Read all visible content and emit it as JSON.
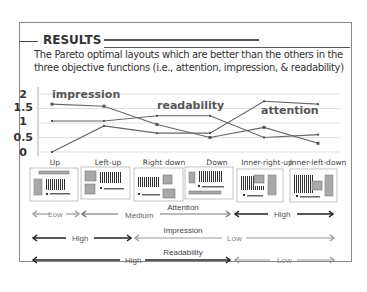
{
  "header": {
    "title": "RESULTS",
    "description_line1": "The Pareto optimal layouts which are better than the others in the",
    "description_line2": "three objective functions  (i.e., attention, impression, & readability)"
  },
  "chart_data": {
    "type": "line",
    "title": "",
    "xlabel": "",
    "ylabel": "",
    "ylim": [
      0,
      2
    ],
    "yticks": [
      "2",
      "1.5",
      "1",
      "0.5",
      "0"
    ],
    "grid": true,
    "categories": [
      "Up",
      "Left-up",
      "Right down",
      "Down",
      "Inner-right-up",
      "Inner-left-down"
    ],
    "series": [
      {
        "name": "impression",
        "values": [
          1.65,
          1.58,
          0.95,
          0.5,
          0.85,
          0.3
        ]
      },
      {
        "name": "readability",
        "values": [
          1.07,
          1.07,
          1.25,
          1.25,
          0.5,
          0.6
        ]
      },
      {
        "name": "attention",
        "values": [
          0,
          0.9,
          0.65,
          0.65,
          1.75,
          1.65
        ]
      }
    ],
    "annotations": [
      "impression",
      "readability",
      "attention"
    ]
  },
  "layouts": [
    "Up",
    "Left-up",
    "Right down",
    "Down",
    "Inner-right-up",
    "Inner-left-down"
  ],
  "scales": [
    {
      "name": "Attention",
      "segments": [
        {
          "label": "Low",
          "level": "low"
        },
        {
          "label": "Medium",
          "level": "medium"
        },
        {
          "label": "High",
          "level": "high"
        }
      ]
    },
    {
      "name": "Impression",
      "segments": [
        {
          "label": "High",
          "level": "high"
        },
        {
          "label": "Low",
          "level": "low"
        }
      ]
    },
    {
      "name": "Readability",
      "segments": [
        {
          "label": "High",
          "level": "high"
        },
        {
          "label": "Low",
          "level": "low"
        }
      ]
    }
  ],
  "colors": {
    "line": "#666666",
    "grid": "#d8d8d8",
    "high_arrow": "#222222",
    "low_arrow": "#9a9a9a",
    "medium_arrow": "#777777",
    "thumb_fill": "#a8a8a8"
  }
}
